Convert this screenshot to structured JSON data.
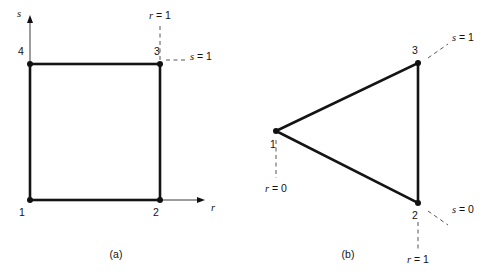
{
  "figure": {
    "background_color": "#ffffff",
    "line_color": "#141414",
    "text_color": "#121212",
    "dash_color": "#555555"
  },
  "panel_a": {
    "caption": "(a)",
    "nodes": [
      {
        "id": "1",
        "label": "1",
        "x": 30,
        "y": 200
      },
      {
        "id": "2",
        "label": "2",
        "x": 160,
        "y": 200
      },
      {
        "id": "3",
        "label": "3",
        "x": 160,
        "y": 64
      },
      {
        "id": "4",
        "label": "4",
        "x": 30,
        "y": 64
      }
    ],
    "axes": {
      "s_label": "s",
      "r_label": "r"
    },
    "annotations": [
      {
        "name": "r-equals-one",
        "text_var": "r",
        "text_rest": " = 1"
      },
      {
        "name": "s-equals-one",
        "text_var": "s",
        "text_rest": " = 1"
      }
    ]
  },
  "panel_b": {
    "caption": "(b)",
    "nodes": [
      {
        "id": "1",
        "label": "1",
        "x": 276,
        "y": 131
      },
      {
        "id": "2",
        "label": "2",
        "x": 418,
        "y": 203
      },
      {
        "id": "3",
        "label": "3",
        "x": 418,
        "y": 63
      }
    ],
    "annotations": [
      {
        "name": "r-equals-zero",
        "text_var": "r",
        "text_rest": " = 0"
      },
      {
        "name": "s-equals-one",
        "text_var": "s",
        "text_rest": " = 1"
      },
      {
        "name": "s-equals-zero",
        "text_var": "s",
        "text_rest": " = 0"
      },
      {
        "name": "r-equals-one",
        "text_var": "r",
        "text_rest": " = 1"
      }
    ]
  }
}
